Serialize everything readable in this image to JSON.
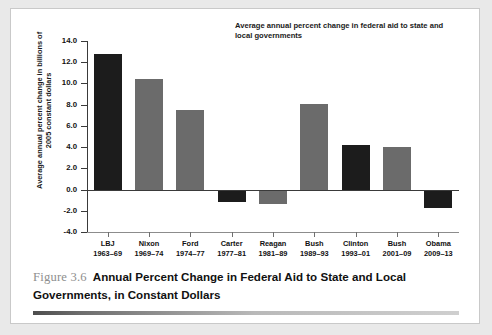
{
  "figure": {
    "number": "Figure 3.6",
    "caption": "Annual Percent Change in Federal Aid to State and Local Governments, in Constant Dollars"
  },
  "chart_data": {
    "type": "bar",
    "title": "",
    "annotation": "Average annual percent change in federal aid to state and local governments",
    "xlabel": "",
    "ylabel": "Average annual percent change in billions of 2005 constant dollars",
    "ylim": [
      -4.0,
      14.0
    ],
    "ytick_labels": [
      "14.0",
      "12.0",
      "10.0",
      "8.0",
      "6.0",
      "4.0",
      "2.0",
      "0.0",
      "-2.0",
      "-4.0"
    ],
    "ytick_values": [
      14.0,
      12.0,
      10.0,
      8.0,
      6.0,
      4.0,
      2.0,
      0.0,
      -2.0,
      -4.0
    ],
    "grid": false,
    "legend": "none",
    "categories": [
      "LBJ",
      "Nixon",
      "Ford",
      "Carter",
      "Reagan",
      "Bush",
      "Clinton",
      "Bush",
      "Obama"
    ],
    "category_years": [
      "1963–69",
      "1969–74",
      "1974–77",
      "1977–81",
      "1981–89",
      "1989–93",
      "1993–01",
      "2001–09",
      "2009–13"
    ],
    "values": [
      12.8,
      10.4,
      7.5,
      -1.2,
      -1.4,
      8.1,
      4.2,
      4.0,
      -1.7
    ],
    "bar_colors": [
      "#1c1c1c",
      "#6b6b6b",
      "#6b6b6b",
      "#1c1c1c",
      "#6b6b6b",
      "#6b6b6b",
      "#1c1c1c",
      "#6b6b6b",
      "#1c1c1c"
    ]
  },
  "colors": {
    "dark_bar": "#1c1c1c",
    "gray_bar": "#6b6b6b",
    "page_background": "#e9e9e9",
    "card_background": "#ffffff"
  }
}
